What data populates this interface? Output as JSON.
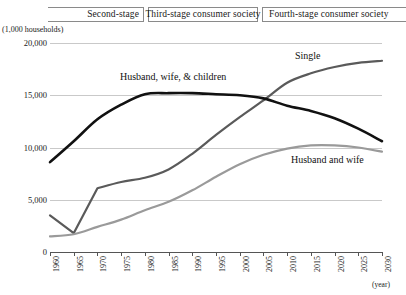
{
  "stages": {
    "items": [
      {
        "label": "Second-stage"
      },
      {
        "label": "Third-stage consumer society"
      },
      {
        "label": "Fourth-stage consumer society"
      }
    ]
  },
  "axis": {
    "unit_caption": "(1,000 households)",
    "x_axis_title": "(year)"
  },
  "chart_data": {
    "type": "line",
    "title": "",
    "subtitle": "",
    "xlabel": "(year)",
    "ylabel": "(1,000 households)",
    "ylim": [
      0,
      20000
    ],
    "yticks": [
      "0",
      "5,000",
      "10,000",
      "15,000",
      "20,000"
    ],
    "ytick_values": [
      0,
      5000,
      10000,
      15000,
      20000
    ],
    "grid": true,
    "legend_position": "inline-labels",
    "x": [
      1960,
      1965,
      1970,
      1975,
      1980,
      1985,
      1990,
      1995,
      2000,
      2005,
      2010,
      2015,
      2020,
      2025,
      2030
    ],
    "xtick_labels": [
      "1960",
      "1965",
      "1970",
      "1975",
      "1980",
      "1985",
      "1990",
      "1995",
      "2000",
      "2005",
      "2010",
      "2015",
      "2020",
      "2025",
      "2030"
    ],
    "series": [
      {
        "name": "Single",
        "color": "#5a5a5a",
        "values": [
          3500,
          1800,
          6100,
          6700,
          7100,
          7900,
          9400,
          11200,
          12900,
          14500,
          16200,
          17100,
          17700,
          18100,
          18300
        ]
      },
      {
        "name": "Husband, wife, & children",
        "color": "#111111",
        "values": [
          8600,
          10600,
          12700,
          14100,
          15100,
          15200,
          15200,
          15100,
          15000,
          14700,
          14000,
          13500,
          12800,
          11800,
          10600
        ]
      },
      {
        "name": "Husband and wife",
        "color": "#9a9a9a",
        "values": [
          1500,
          1700,
          2400,
          3100,
          4000,
          4800,
          5900,
          7200,
          8400,
          9300,
          9900,
          10200,
          10200,
          10000,
          9600
        ]
      }
    ],
    "annotations": [
      {
        "text": "Single",
        "x": 2014,
        "y": 19300
      },
      {
        "text": "Husband, wife, & children",
        "x": 1975,
        "y": 17300
      },
      {
        "text": "Husband and wife",
        "x": 2013,
        "y": 9200
      }
    ]
  }
}
